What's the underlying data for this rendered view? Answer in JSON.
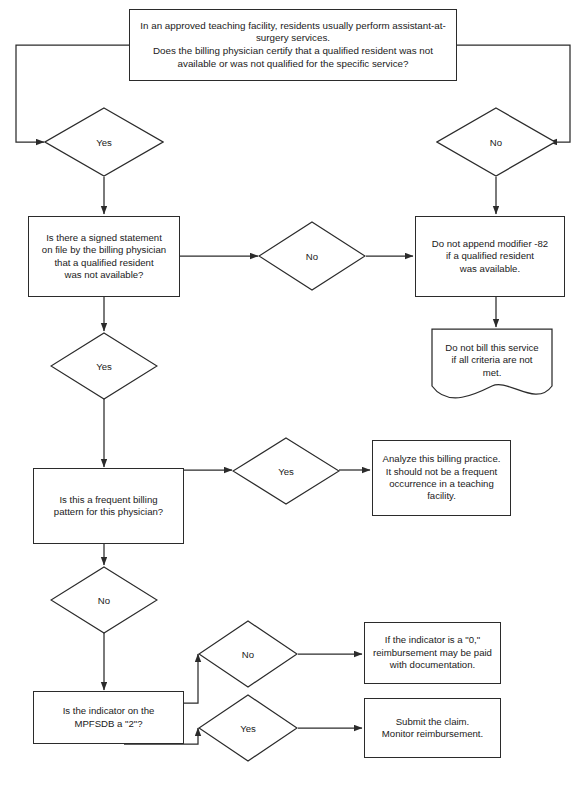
{
  "colors": {
    "stroke": "#2b2b2b",
    "text": "#1a1a1a",
    "background": "#ffffff"
  },
  "nodes": {
    "start_question": {
      "shape": "process",
      "text": "In an approved teaching facility, residents usually perform assistant-at-surgery services.\nDoes the billing physician certify that a qualified resident was not available or was not qualified for the specific service?"
    },
    "decision_yes_top": {
      "shape": "decision",
      "text": "Yes"
    },
    "decision_no_top": {
      "shape": "decision",
      "text": "No"
    },
    "signed_statement": {
      "shape": "process",
      "text": "Is there a signed statement\non file by the billing physician\nthat a qualified resident\nwas not available?"
    },
    "decision_no_mid": {
      "shape": "decision",
      "text": "No"
    },
    "do_not_append": {
      "shape": "process",
      "text": "Do not append modifier -82\nif a qualified resident\nwas available."
    },
    "do_not_bill": {
      "shape": "document",
      "text": "Do not bill this service\nif all criteria are not\nmet."
    },
    "decision_yes_mid": {
      "shape": "decision",
      "text": "Yes"
    },
    "frequent_pattern": {
      "shape": "process",
      "text": "Is this a frequent billing\npattern for this physician?"
    },
    "decision_yes_frequent": {
      "shape": "decision",
      "text": "Yes"
    },
    "analyze_practice": {
      "shape": "process",
      "text": "Analyze this billing practice.\nIt should not be a frequent\noccurrence in a teaching\nfacility."
    },
    "decision_no_frequent": {
      "shape": "decision",
      "text": "No"
    },
    "indicator_question": {
      "shape": "process",
      "text": "Is the indicator on the\nMPFSDB a \"2\"?"
    },
    "decision_no_indicator": {
      "shape": "decision",
      "text": "No"
    },
    "indicator_zero": {
      "shape": "process",
      "text": "If the indicator is a \"0,\"\nreimbursement may be paid\nwith documentation."
    },
    "decision_yes_indicator": {
      "shape": "decision",
      "text": "Yes"
    },
    "submit_claim": {
      "shape": "process",
      "text": "Submit the claim.\nMonitor reimbursement."
    }
  }
}
